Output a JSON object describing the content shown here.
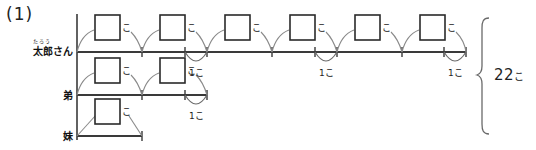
{
  "page": {
    "question_number": "(1)",
    "total_label": "22",
    "total_unit": "こ"
  },
  "rows": [
    {
      "id": "taro",
      "label": "太郎さん",
      "furigana": "たろう",
      "boxes": [
        {
          "value": "",
          "unit": "こ"
        },
        {
          "value": "",
          "unit": "こ"
        },
        {
          "value": "",
          "unit": "こ"
        },
        {
          "value": "",
          "unit": "こ"
        },
        {
          "value": "",
          "unit": "こ"
        },
        {
          "value": "",
          "unit": "こ"
        }
      ],
      "arcs": [
        {
          "value": "1",
          "unit": "こ"
        },
        {
          "value": "1",
          "unit": "こ"
        },
        {
          "value": "1",
          "unit": "こ"
        }
      ]
    },
    {
      "id": "otouto",
      "label": "弟",
      "furigana": "",
      "boxes": [
        {
          "value": "",
          "unit": "こ"
        },
        {
          "value": "",
          "unit": "こ"
        }
      ],
      "arcs": [
        {
          "value": "1",
          "unit": "こ"
        }
      ]
    },
    {
      "id": "imouto",
      "label": "妹",
      "furigana": "",
      "boxes": [
        {
          "value": "",
          "unit": "こ"
        }
      ],
      "arcs": []
    }
  ],
  "colors": {
    "ink": "#1a1a1a",
    "line": "#3a3a3a",
    "thin": "#555555",
    "paper": "#ffffff"
  }
}
